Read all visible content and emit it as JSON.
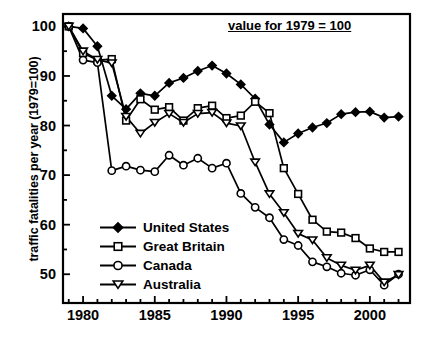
{
  "chart_data": {
    "type": "line",
    "title": "",
    "annotation": "value for 1979 = 100",
    "xlabel": "",
    "ylabel": "traffic fatalities per year (1979=100)",
    "xlim": [
      1978.6,
      2002.8
    ],
    "ylim": [
      44.2,
      102.5
    ],
    "xticks": [
      1980,
      1985,
      1990,
      1995,
      2000
    ],
    "yticks": [
      50,
      60,
      70,
      80,
      90,
      100
    ],
    "xminor_step": 1,
    "yminor_step": 5,
    "grid": false,
    "legend_position": "lower-left-inside",
    "x": [
      1979,
      1980,
      1981,
      1982,
      1983,
      1984,
      1985,
      1986,
      1987,
      1988,
      1989,
      1990,
      1991,
      1992,
      1993,
      1994,
      1995,
      1996,
      1997,
      1998,
      1999,
      2000,
      2001,
      2002
    ],
    "series": [
      {
        "name": "United States",
        "marker": "filled-diamond",
        "color": "#000000",
        "values": [
          100.0,
          99.6,
          96.0,
          86.0,
          83.3,
          86.5,
          86.0,
          88.6,
          89.6,
          91.0,
          92.1,
          90.5,
          88.3,
          85.4,
          80.2,
          76.6,
          78.4,
          79.6,
          80.5,
          82.3,
          82.7,
          82.8,
          81.6,
          81.8
        ]
      },
      {
        "name": "Great Britain",
        "marker": "open-square",
        "color": "#000000",
        "values": [
          100.0,
          94.6,
          93.2,
          93.4,
          81.0,
          85.3,
          83.2,
          83.7,
          81.0,
          83.5,
          84.0,
          81.5,
          82.0,
          84.8,
          82.5,
          71.4,
          66.2,
          61.0,
          58.6,
          58.4,
          57.3,
          55.2,
          54.5,
          54.5
        ]
      },
      {
        "name": "Canada",
        "marker": "open-circle",
        "color": "#000000",
        "values": [
          100.0,
          93.2,
          92.7,
          70.9,
          71.8,
          71.0,
          70.7,
          74.0,
          72.0,
          73.4,
          71.4,
          72.4,
          66.3,
          63.5,
          61.4,
          57.0,
          55.8,
          52.5,
          51.5,
          50.2,
          49.8,
          50.9,
          47.8,
          50.0
        ]
      },
      {
        "name": "Australia",
        "marker": "open-triangle-down",
        "color": "#000000",
        "values": [
          100.0,
          95.0,
          93.3,
          92.6,
          81.8,
          78.4,
          80.6,
          82.4,
          80.6,
          82.4,
          82.6,
          80.5,
          79.9,
          72.6,
          66.2,
          62.4,
          58.2,
          56.9,
          53.3,
          51.8,
          50.8,
          51.8,
          48.4,
          49.9
        ]
      }
    ]
  },
  "axes": {
    "y_title": "traffic fatalities per year (1979=100)",
    "y_tick_labels": [
      "100",
      "90",
      "80",
      "70",
      "60",
      "50"
    ],
    "x_tick_labels": [
      "1980",
      "1985",
      "1990",
      "1995",
      "2000"
    ]
  },
  "annotation": {
    "text": "value for 1979 = 100"
  },
  "legend": {
    "items": [
      {
        "label": "United States",
        "marker": "filled-diamond"
      },
      {
        "label": "Great Britain",
        "marker": "open-square"
      },
      {
        "label": "Canada",
        "marker": "open-circle"
      },
      {
        "label": "Australia",
        "marker": "open-triangle-down"
      }
    ]
  }
}
